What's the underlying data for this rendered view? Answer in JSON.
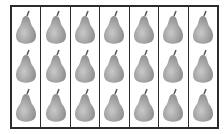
{
  "figure": {
    "columns": 7,
    "rows": 3,
    "item": "pear",
    "total_items": 21,
    "colors": {
      "border": "#2b2b2b",
      "pear_light": "#c9c9c9",
      "pear_dark": "#8a8a8a",
      "stem": "#555555"
    }
  }
}
